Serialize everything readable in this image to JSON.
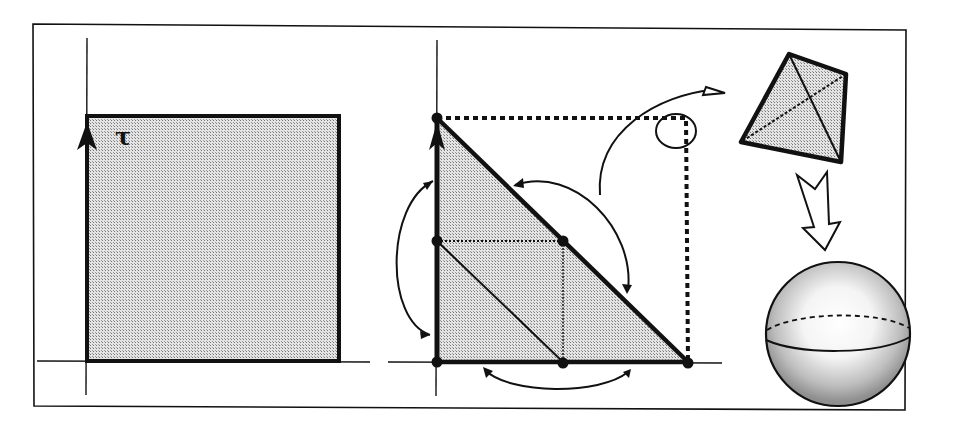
{
  "figure": {
    "labels": {
      "tau": "τ"
    },
    "colors": {
      "ink": "#111111",
      "fill": "#c9c9c9",
      "background": "#ffffff"
    },
    "panels": [
      {
        "name": "square-domain",
        "shape": "square",
        "axis_label": "τ"
      },
      {
        "name": "triangle-domain",
        "shape": "right-triangle",
        "marked_points": 6,
        "symmetry_arrows": 4,
        "dotted_completion": "square"
      },
      {
        "name": "tetrahedron",
        "shape": "tetrahedron"
      },
      {
        "name": "sphere",
        "shape": "sphere"
      }
    ],
    "arrows": [
      {
        "from": "triangle-corner",
        "to": "tetrahedron",
        "style": "curved"
      },
      {
        "from": "tetrahedron",
        "to": "sphere",
        "style": "hollow"
      }
    ]
  }
}
